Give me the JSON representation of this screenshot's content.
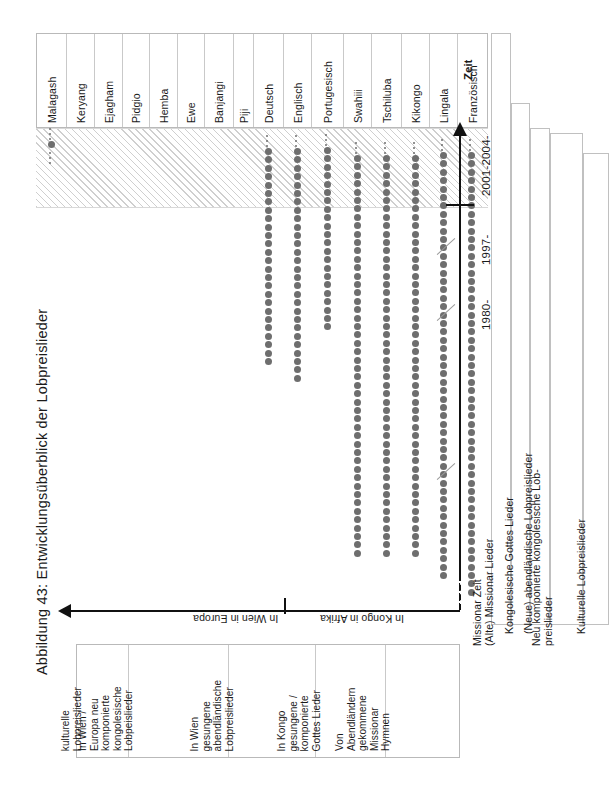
{
  "figure": {
    "caption": "Abbildung 43: Entwicklungsüberblick der Lobpreislieder"
  },
  "axes": {
    "time_axis_label": "Zeit",
    "time_ticks": [
      "1980-",
      "1997-",
      "2001-2004-"
    ],
    "region_labels": [
      "In Wien in Europa",
      "In Kongo in Afrika"
    ]
  },
  "categories": [
    {
      "label": "Malagash"
    },
    {
      "label": "Keryang"
    },
    {
      "label": "Ejagham"
    },
    {
      "label": "Pidgio"
    },
    {
      "label": "Hemba"
    },
    {
      "label": "Ewe"
    },
    {
      "label": "Banjangi"
    },
    {
      "label": "Piji"
    },
    {
      "label": "Deutsch"
    },
    {
      "label": "Englisch"
    },
    {
      "label": "Portugesisch"
    },
    {
      "label": "Swahiii"
    },
    {
      "label": "Tschiluba"
    },
    {
      "label": "Kikongo"
    },
    {
      "label": "Lingala"
    },
    {
      "label": "Französisch"
    }
  ],
  "descriptions": [
    {
      "text": "kulturelle\nLobpreislieder"
    },
    {
      "text": "In Wien /\nEuropa neu\nkomponierte\nkongolesische\nLobpeislieder"
    },
    {
      "text": "In Wien\ngesungene\nabendländische\nLobpreislieder"
    },
    {
      "text": "In Kongo\ngesungene /\nkomponierte\nGottes Lieder"
    },
    {
      "text": "Von\nAbendländern\ngekommene\nMissionar\nHymnen"
    }
  ],
  "eras": [
    {
      "text": "Missionar Zeit\n(Alte) Missionar Lieder"
    },
    {
      "text": "Kongolesische Gottes Lieder"
    },
    {
      "text": "(Neue) abendländische Lobpreislieder"
    },
    {
      "text": "Neu komponierte kongolesische Lob-\npreislieder"
    },
    {
      "text": "Kulturelle Lobpreislieder"
    }
  ],
  "colors": {
    "dot": "#6e6e6e",
    "axis": "#111111",
    "hatch": "#cfcfcf",
    "border": "#b9b9b9"
  },
  "chart_data": {
    "type": "scatter",
    "title": "Abbildung 43: Entwicklungsüberblick der Lobpreislieder",
    "xlabel": "",
    "ylabel": "Zeit",
    "grid": false,
    "legend_position": "right",
    "categories": [
      "Malagash",
      "Keryang",
      "Ejagham",
      "Pidgio",
      "Hemba",
      "Ewe",
      "Banjangi",
      "Piji",
      "Deutsch",
      "Englisch",
      "Portugesisch",
      "Swahiii",
      "Tschiluba",
      "Kikongo",
      "Lingala",
      "Französisch"
    ],
    "time_ticks": [
      "1980-",
      "1997-",
      "2001-2004-"
    ],
    "series": [
      {
        "name": "Malagash",
        "col": 0,
        "dot_top": 141,
        "dot_count": 1,
        "has_ellipsis": true
      },
      {
        "name": "Keryang",
        "col": 1,
        "dot_top": 0,
        "dot_count": 0,
        "has_ellipsis": false
      },
      {
        "name": "Ejagham",
        "col": 2,
        "dot_top": 0,
        "dot_count": 0,
        "has_ellipsis": false
      },
      {
        "name": "Pidgio",
        "col": 3,
        "dot_top": 0,
        "dot_count": 0,
        "has_ellipsis": false
      },
      {
        "name": "Hemba",
        "col": 4,
        "dot_top": 0,
        "dot_count": 0,
        "has_ellipsis": false
      },
      {
        "name": "Ewe",
        "col": 5,
        "dot_top": 0,
        "dot_count": 0,
        "has_ellipsis": false
      },
      {
        "name": "Banjangi",
        "col": 6,
        "dot_top": 0,
        "dot_count": 0,
        "has_ellipsis": false
      },
      {
        "name": "Piji",
        "col": 7,
        "dot_top": 0,
        "dot_count": 0,
        "has_ellipsis": false
      },
      {
        "name": "Deutsch",
        "col": 8,
        "dot_top": 148,
        "dot_count": 26,
        "has_ellipsis": true
      },
      {
        "name": "Englisch",
        "col": 9,
        "dot_top": 148,
        "dot_count": 28,
        "has_ellipsis": true
      },
      {
        "name": "Portugesisch",
        "col": 10,
        "dot_top": 147,
        "dot_count": 22,
        "has_ellipsis": true
      },
      {
        "name": "Swahiii",
        "col": 11,
        "dot_top": 155,
        "dot_count": 48,
        "has_ellipsis": true
      },
      {
        "name": "Tschiluba",
        "col": 12,
        "dot_top": 155,
        "dot_count": 48,
        "has_ellipsis": true
      },
      {
        "name": "Kikongo",
        "col": 13,
        "dot_top": 155,
        "dot_count": 48,
        "has_ellipsis": true
      },
      {
        "name": "Lingala",
        "col": 14,
        "dot_top": 152,
        "dot_count": 51,
        "has_ellipsis": true
      },
      {
        "name": "Französisch",
        "col": 15,
        "dot_top": 152,
        "dot_count": 53,
        "has_ellipsis": true
      }
    ],
    "annotations": [
      "Missionar Zeit / (Alte) Missionar Lieder",
      "Kongolesische Gottes Lieder",
      "(Neue) abendländische Lobpreislieder",
      "Neu komponierte kongolesische Lob-preislieder",
      "Kulturelle Lobpreislieder"
    ]
  }
}
